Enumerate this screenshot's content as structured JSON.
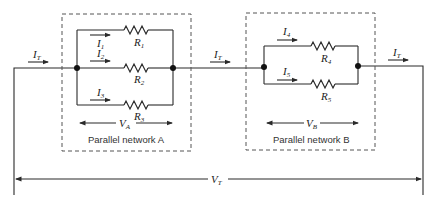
{
  "diagram": {
    "total_current": {
      "symbol": "I",
      "sub": "T"
    },
    "total_voltage": {
      "symbol": "V",
      "sub": "T"
    },
    "network_a": {
      "caption": "Parallel network A",
      "voltage": {
        "symbol": "V",
        "sub": "A"
      },
      "branches": [
        {
          "current": {
            "symbol": "I",
            "sub": "1"
          },
          "resistor": {
            "symbol": "R",
            "sub": "1"
          }
        },
        {
          "current": {
            "symbol": "I",
            "sub": "2"
          },
          "resistor": {
            "symbol": "R",
            "sub": "2"
          }
        },
        {
          "current": {
            "symbol": "I",
            "sub": "3"
          },
          "resistor": {
            "symbol": "R",
            "sub": "3"
          }
        }
      ]
    },
    "network_b": {
      "caption": "Parallel network B",
      "voltage": {
        "symbol": "V",
        "sub": "B"
      },
      "branches": [
        {
          "current": {
            "symbol": "I",
            "sub": "4"
          },
          "resistor": {
            "symbol": "R",
            "sub": "4"
          }
        },
        {
          "current": {
            "symbol": "I",
            "sub": "5"
          },
          "resistor": {
            "symbol": "R",
            "sub": "5"
          }
        }
      ]
    }
  }
}
